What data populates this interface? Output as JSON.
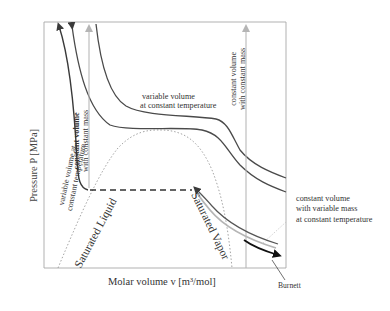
{
  "figure": {
    "y_axis_label": "Pressure P [MPa]",
    "x_axis_label": "Molar volume v [m³/mol]",
    "annotations": {
      "variable_volume_constant_T_top": [
        "variable volume",
        "at constant temperature"
      ],
      "constant_volume_constant_mass_right": [
        "constant volume",
        "with constant mass"
      ],
      "constant_volume_constant_mass_left": [
        "constant volume",
        "with constant mass"
      ],
      "variable_volume_constant_T_left": [
        "variable volume at",
        "constant temperature"
      ],
      "constant_volume_variable_mass": [
        "constant volume",
        "with variable mass",
        "at constant temperature"
      ],
      "burnett": "Burnett",
      "saturated_liquid": "Saturated Liquid",
      "saturated_vapor": "Saturated Vapor"
    },
    "colors": {
      "isotherm": "#4a4a4a",
      "isochore_light": "#b8b8b8",
      "dome": "#9a9a9a",
      "frame": "#a0a0a0",
      "burnett_arrow": "#111111"
    }
  }
}
